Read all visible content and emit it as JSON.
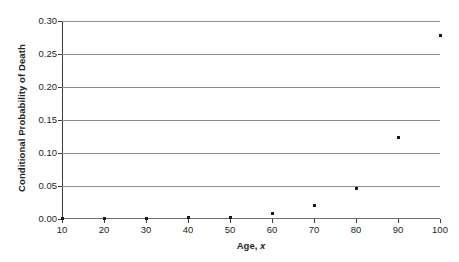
{
  "chart_data": {
    "type": "scatter",
    "title": "",
    "xlabel_prefix": "Age,",
    "xlabel_variable": "x",
    "xlabel": "Age, x",
    "ylabel": "Conditional Probability of Death",
    "xlim": [
      10,
      100
    ],
    "ylim": [
      0.0,
      0.3
    ],
    "grid": true,
    "grid_axis": "y",
    "legend": false,
    "x_ticks": [
      10,
      20,
      30,
      40,
      50,
      60,
      70,
      80,
      90,
      100
    ],
    "x_tick_labels": [
      "10",
      "20",
      "30",
      "40",
      "50",
      "60",
      "70",
      "80",
      "90",
      "100"
    ],
    "y_ticks": [
      0.0,
      0.05,
      0.1,
      0.15,
      0.2,
      0.25,
      0.3
    ],
    "y_tick_labels": [
      "0.00",
      "0.05",
      "0.10",
      "0.15",
      "0.20",
      "0.25",
      "0.30"
    ],
    "x": [
      10,
      20,
      30,
      40,
      50,
      60,
      70,
      80,
      90,
      100
    ],
    "values": [
      0.0005,
      0.001,
      0.0013,
      0.0018,
      0.003,
      0.009,
      0.02,
      0.046,
      0.124,
      0.278
    ],
    "marker": "square",
    "marker_color": "#1a1a1a",
    "gridline_color": "#8d8d8d",
    "axis_color": "#3b3b3b",
    "background_color": "#ffffff"
  }
}
